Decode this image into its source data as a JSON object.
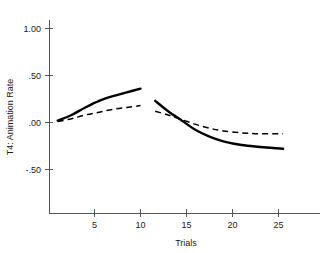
{
  "chart_data": {
    "type": "line",
    "title": "",
    "xlabel": "Trials",
    "ylabel": "T4: Animation Rate",
    "xlim": [
      0,
      29
    ],
    "ylim": [
      -0.75,
      1.15
    ],
    "grid": false,
    "legend": "none",
    "xticks": [
      5,
      10,
      15,
      20,
      25
    ],
    "xtick_labels": [
      "5",
      "10",
      "15",
      "20",
      "25"
    ],
    "yticks": [
      1.0,
      0.5,
      0.0,
      -0.5
    ],
    "ytick_labels": [
      "1.00",
      ".50",
      ".00",
      "-.50"
    ],
    "series": [
      {
        "name": "solid-phase-1",
        "style": "solid",
        "x": [
          1.0,
          2.5,
          4.0,
          5.5,
          7.0,
          8.5,
          10.0
        ],
        "values": [
          0.02,
          0.08,
          0.16,
          0.23,
          0.28,
          0.32,
          0.36
        ]
      },
      {
        "name": "dashed-phase-1",
        "style": "dashed",
        "x": [
          1.0,
          2.5,
          4.0,
          5.5,
          7.0,
          8.5,
          10.0
        ],
        "values": [
          0.01,
          0.04,
          0.08,
          0.11,
          0.14,
          0.16,
          0.18
        ]
      },
      {
        "name": "solid-phase-2",
        "style": "solid",
        "x": [
          11.6,
          13.0,
          14.5,
          16.0,
          17.5,
          19.0,
          21.0,
          23.0,
          25.5
        ],
        "values": [
          0.23,
          0.12,
          0.02,
          -0.08,
          -0.15,
          -0.2,
          -0.24,
          -0.26,
          -0.28
        ]
      },
      {
        "name": "dashed-phase-2",
        "style": "dashed",
        "x": [
          11.6,
          13.0,
          14.5,
          16.0,
          17.5,
          19.0,
          21.0,
          23.0,
          25.5
        ],
        "values": [
          0.12,
          0.08,
          0.03,
          -0.02,
          -0.06,
          -0.09,
          -0.11,
          -0.12,
          -0.12
        ]
      }
    ]
  }
}
